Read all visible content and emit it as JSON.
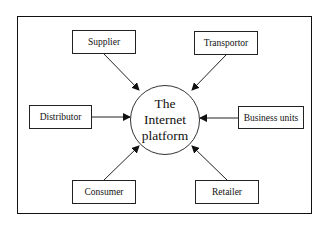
{
  "diagram": {
    "hub": {
      "lines": [
        "The",
        "Internet",
        "platform"
      ]
    },
    "nodes": [
      {
        "id": "supplier",
        "label": "Supplier",
        "x": 72,
        "y": 30,
        "w": 64,
        "h": 24
      },
      {
        "id": "transportor",
        "label": "Transportor",
        "x": 194,
        "y": 31,
        "w": 64,
        "h": 24
      },
      {
        "id": "distributor",
        "label": "Distributor",
        "x": 29,
        "y": 105,
        "w": 63,
        "h": 24
      },
      {
        "id": "business-units",
        "label": "Business units",
        "x": 238,
        "y": 106,
        "w": 66,
        "h": 23
      },
      {
        "id": "consumer",
        "label": "Consumer",
        "x": 72,
        "y": 180,
        "w": 64,
        "h": 24
      },
      {
        "id": "retailer",
        "label": "Retailer",
        "x": 195,
        "y": 180,
        "w": 64,
        "h": 24
      }
    ],
    "edges": [
      {
        "from": "supplier",
        "to": "hub",
        "x1": 104,
        "y1": 54,
        "x2": 139,
        "y2": 90
      },
      {
        "from": "transportor",
        "to": "hub",
        "x1": 226,
        "y1": 55,
        "x2": 192,
        "y2": 90
      },
      {
        "from": "distributor",
        "to": "hub",
        "x1": 92,
        "y1": 117,
        "x2": 130,
        "y2": 117
      },
      {
        "from": "business-units",
        "to": "hub",
        "x1": 238,
        "y1": 118,
        "x2": 200,
        "y2": 118
      },
      {
        "from": "consumer",
        "to": "hub",
        "x1": 104,
        "y1": 180,
        "x2": 139,
        "y2": 146
      },
      {
        "from": "retailer",
        "to": "hub",
        "x1": 227,
        "y1": 180,
        "x2": 192,
        "y2": 146
      }
    ]
  }
}
